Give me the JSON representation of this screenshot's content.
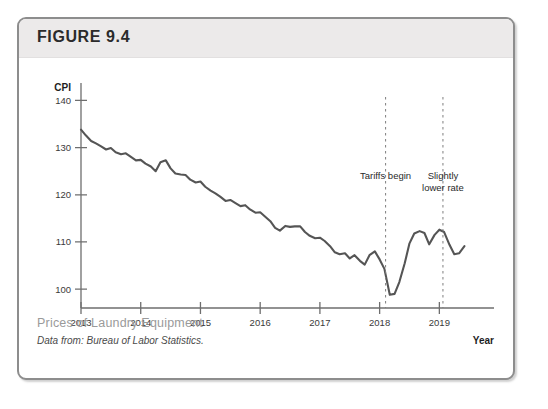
{
  "figure": {
    "label": "FIGURE 9.4",
    "caption_title": "Prices of Laundry Equipment",
    "caption_source": "Data from: Bureau of Labor Statistics."
  },
  "chart_data": {
    "type": "line",
    "title": "Prices of Laundry Equipment",
    "xlabel": "Year",
    "ylabel": "CPI",
    "xlim": [
      2013.0,
      2019.58
    ],
    "ylim": [
      96,
      142
    ],
    "grid": false,
    "legend": "none",
    "y_ticks": [
      100,
      110,
      120,
      130,
      140
    ],
    "x_ticks": [
      2013,
      2014,
      2015,
      2016,
      2017,
      2018,
      2019
    ],
    "x_tick_labels": [
      "2013",
      "2014",
      "2015",
      "2016",
      "2017",
      "2018",
      "2019"
    ],
    "line_color": "#555555",
    "annotations": [
      {
        "name": "tariffs-begin",
        "text": "Tariffs begin",
        "x": 2018.1,
        "lines": [
          "Tariffs begin"
        ]
      },
      {
        "name": "slightly-lower-rate",
        "text": "Slightly lower rate",
        "x": 2019.06,
        "lines": [
          "Slightly",
          "lower rate"
        ]
      }
    ],
    "series": [
      {
        "name": "CPI, Laundry Equipment",
        "x": [
          2013.0,
          2013.08,
          2013.17,
          2013.25,
          2013.33,
          2013.42,
          2013.5,
          2013.58,
          2013.67,
          2013.75,
          2013.83,
          2013.92,
          2014.0,
          2014.08,
          2014.17,
          2014.25,
          2014.33,
          2014.42,
          2014.5,
          2014.58,
          2014.67,
          2014.75,
          2014.83,
          2014.92,
          2015.0,
          2015.08,
          2015.17,
          2015.25,
          2015.33,
          2015.42,
          2015.5,
          2015.58,
          2015.67,
          2015.75,
          2015.83,
          2015.92,
          2016.0,
          2016.08,
          2016.17,
          2016.25,
          2016.33,
          2016.42,
          2016.5,
          2016.58,
          2016.67,
          2016.75,
          2016.83,
          2016.92,
          2017.0,
          2017.08,
          2017.17,
          2017.25,
          2017.33,
          2017.42,
          2017.5,
          2017.58,
          2017.67,
          2017.75,
          2017.83,
          2017.92,
          2018.0,
          2018.08,
          2018.17,
          2018.25,
          2018.33,
          2018.42,
          2018.5,
          2018.58,
          2018.67,
          2018.75,
          2018.83,
          2018.92,
          2019.0,
          2019.08,
          2019.17,
          2019.25,
          2019.33,
          2019.42
        ],
        "values": [
          133.8,
          132.6,
          131.4,
          130.9,
          130.3,
          129.6,
          129.9,
          129.0,
          128.6,
          128.8,
          128.1,
          127.3,
          127.4,
          126.6,
          126.0,
          125.0,
          126.9,
          127.3,
          125.6,
          124.5,
          124.3,
          124.2,
          123.2,
          122.6,
          122.8,
          121.7,
          120.9,
          120.3,
          119.6,
          118.7,
          118.9,
          118.3,
          117.6,
          117.8,
          116.9,
          116.2,
          116.3,
          115.4,
          114.4,
          113.0,
          112.4,
          113.4,
          113.2,
          113.3,
          113.3,
          112.1,
          111.3,
          110.8,
          110.9,
          110.2,
          109.1,
          107.8,
          107.4,
          107.6,
          106.5,
          107.2,
          106.0,
          105.2,
          107.2,
          108.0,
          106.3,
          104.3,
          98.8,
          99.0,
          101.5,
          105.5,
          109.7,
          111.8,
          112.3,
          111.9,
          109.5,
          111.5,
          112.6,
          112.1,
          109.4,
          107.4,
          107.6,
          109.1
        ]
      }
    ]
  }
}
